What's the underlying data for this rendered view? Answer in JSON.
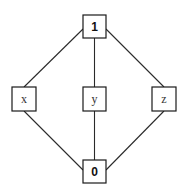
{
  "diagram": {
    "type": "hasse-diagram",
    "nodes": {
      "top": {
        "label": "1"
      },
      "x": {
        "label": "x"
      },
      "y": {
        "label": "y"
      },
      "z": {
        "label": "z"
      },
      "bottom": {
        "label": "0"
      }
    },
    "edges": [
      {
        "from": "1",
        "to": "x"
      },
      {
        "from": "1",
        "to": "y"
      },
      {
        "from": "1",
        "to": "z"
      },
      {
        "from": "x",
        "to": "0"
      },
      {
        "from": "y",
        "to": "0"
      },
      {
        "from": "z",
        "to": "0"
      }
    ]
  }
}
